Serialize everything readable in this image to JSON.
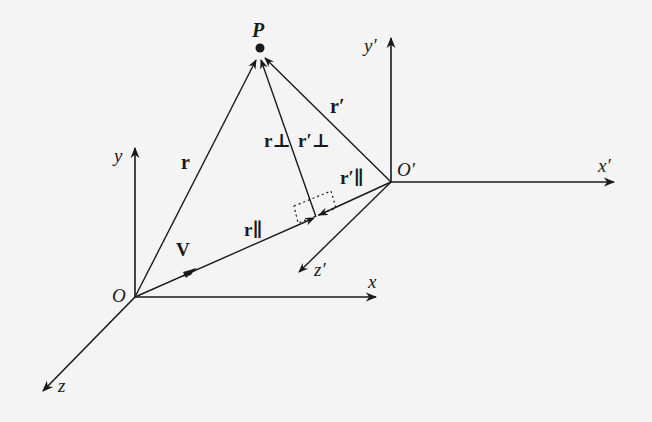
{
  "diagram": {
    "type": "vector-decomposition",
    "colors": {
      "background": "#f4f4f4",
      "ink": "#1a1a1a"
    },
    "points": {
      "O": {
        "label": "O",
        "x": 135,
        "y": 297
      },
      "O_prime": {
        "label": "O′",
        "x": 391,
        "y": 182
      },
      "P": {
        "label": "P",
        "x": 260,
        "y": 48
      },
      "foot": {
        "x": 316,
        "y": 217
      }
    },
    "axes": {
      "x": "x",
      "y": "y",
      "z": "z",
      "x_prime": "x′",
      "y_prime": "y′",
      "z_prime": "z′"
    },
    "vectors": {
      "r": "r",
      "r_prime": "r′",
      "r_perp": "r⊥",
      "r_perp_prime": "r′⊥",
      "r_par": "r∥",
      "r_par_prime": "r′∥",
      "V": "V"
    }
  }
}
